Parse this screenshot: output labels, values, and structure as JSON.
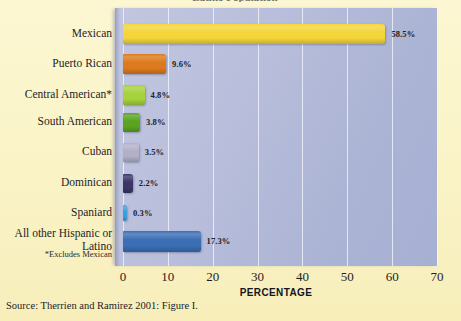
{
  "figure": {
    "title_sliver": "Latino Population",
    "source": "Source: Therrien and Ramirez 2001: Figure I.",
    "footnote": "*Excludes Mexican",
    "page_background": "#fbf5cd",
    "plot_background": "#b4bbd8"
  },
  "chart_data": {
    "type": "bar",
    "orientation": "horizontal",
    "title": "",
    "xlabel": "PERCENTAGE",
    "ylabel": "",
    "xlim": [
      0,
      70
    ],
    "xticks": [
      0,
      10,
      20,
      30,
      40,
      50,
      60,
      70
    ],
    "xtick_labels": [
      "0",
      "10",
      "20",
      "30",
      "40",
      "50",
      "60",
      "70"
    ],
    "grid": true,
    "legend": "none",
    "categories": [
      "Mexican",
      "Puerto Rican",
      "Central American*",
      "South American",
      "Cuban",
      "Dominican",
      "Spaniard",
      "All other Hispanic or Latino"
    ],
    "values": [
      58.5,
      9.6,
      4.8,
      3.8,
      3.5,
      2.2,
      0.3,
      17.3
    ],
    "data_labels": [
      "58.5%",
      "9.6%",
      "4.8%",
      "3.8%",
      "3.5%",
      "2.2%",
      "0.3%",
      "17.3%"
    ],
    "bar_colors": [
      "#f3d53a",
      "#dd7a1d",
      "#a6d23c",
      "#5aa420",
      "#b2b0c9",
      "#3a3668",
      "#3aa0dc",
      "#3b6eb5"
    ]
  }
}
